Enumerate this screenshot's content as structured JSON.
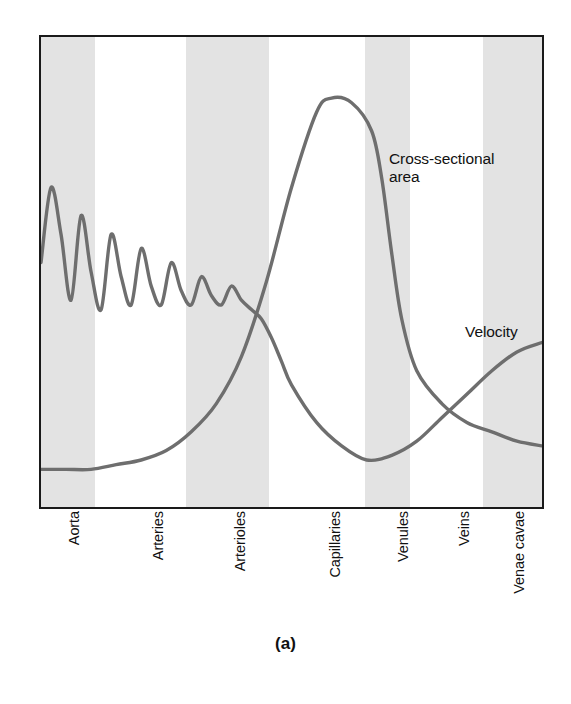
{
  "figure": {
    "caption": "(a)",
    "background_color": "#ffffff",
    "frame_color": "#1a1a1a",
    "band_color": "#e3e3e3",
    "curve_color": "#6e6e6e"
  },
  "annotations": [
    {
      "name": "cross-sectional-area",
      "text": "Cross-sectional\narea"
    },
    {
      "name": "velocity",
      "text": "Velocity"
    }
  ],
  "annotation_area_text": "Cross-sectional\narea",
  "annotation_velocity_text": "Velocity",
  "categories": [
    {
      "label": "Aorta",
      "center_pct": 5.4,
      "shaded": true
    },
    {
      "label": "Arteries",
      "center_pct": 22.0,
      "shaded": false
    },
    {
      "label": "Arterioles",
      "center_pct": 38.2,
      "shaded": true
    },
    {
      "label": "Capillaries",
      "center_pct": 57.0,
      "shaded": false
    },
    {
      "label": "Venules",
      "center_pct": 70.5,
      "shaded": true
    },
    {
      "label": "Veins",
      "center_pct": 82.5,
      "shaded": false
    },
    {
      "label": "Venae cavae",
      "center_pct": 93.5,
      "shaded": true
    }
  ],
  "bands": [
    {
      "name": "band-aorta",
      "left_pct": 0.0,
      "width_pct": 10.8
    },
    {
      "name": "band-arterioles",
      "left_pct": 29.0,
      "width_pct": 16.5
    },
    {
      "name": "band-venules",
      "left_pct": 64.6,
      "width_pct": 9.0
    },
    {
      "name": "band-venae-cavae",
      "left_pct": 88.3,
      "width_pct": 11.7
    }
  ],
  "chart_data": {
    "type": "line",
    "title": "",
    "subtitle": "",
    "xlabel": "",
    "ylabel": "",
    "grid": false,
    "legend": "inline annotations",
    "axis_tick_labels": [
      "Aorta",
      "Arteries",
      "Arterioles",
      "Capillaries",
      "Venules",
      "Veins",
      "Venae cavae"
    ],
    "xlim": [
      0,
      100
    ],
    "ylim": [
      0,
      100
    ],
    "series": [
      {
        "name": "Velocity",
        "color": "#6e6e6e",
        "description": "High and strongly pulsatile in the aorta, damping progressively through arteries and arterioles, falling to a minimum in the capillaries, then rising again through venules, veins and venae cavae.",
        "x": [
          0,
          2,
          4,
          6,
          8,
          10,
          12,
          14,
          16,
          18,
          20,
          22,
          24,
          26,
          28,
          30,
          32,
          34,
          36,
          38,
          40,
          42,
          44,
          46,
          48,
          50,
          55,
          60,
          65,
          70,
          75,
          80,
          85,
          90,
          95,
          100
        ],
        "y": [
          52,
          68,
          58,
          44,
          62,
          50,
          42,
          58,
          49,
          43,
          55,
          47,
          43,
          52,
          46,
          43,
          49,
          45,
          43,
          47,
          44,
          42,
          40,
          36,
          31,
          26,
          18,
          13,
          10,
          11,
          14,
          19,
          24,
          29,
          33,
          35
        ]
      },
      {
        "name": "Cross-sectional area",
        "color": "#6e6e6e",
        "description": "Very low in the aorta and large arteries, rising steeply in the arterioles to a broad maximum in the capillaries, then falling steeply past the venules and declining gently through veins and venae cavae.",
        "x": [
          0,
          5,
          10,
          15,
          20,
          25,
          30,
          35,
          40,
          45,
          50,
          55,
          58,
          62,
          66,
          68,
          70,
          72,
          75,
          80,
          85,
          90,
          95,
          100
        ],
        "y": [
          8,
          8,
          8,
          9,
          10,
          12,
          16,
          22,
          32,
          48,
          68,
          84,
          87,
          86,
          80,
          70,
          54,
          40,
          29,
          22,
          18,
          16,
          14,
          13
        ]
      }
    ]
  }
}
